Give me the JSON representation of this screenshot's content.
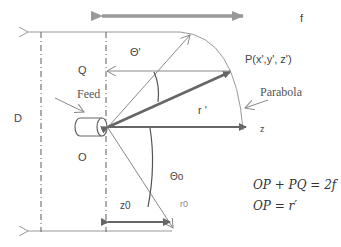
{
  "labels": {
    "f": "f",
    "theta_prime": "Θ'",
    "point": "P(x',y', z')",
    "Q": "Q",
    "feed": "Feed",
    "parabola": "Parabola",
    "D": "D",
    "r_prime": "r '",
    "z": "z",
    "O": "O",
    "theta0": "Θo",
    "z0": "z0",
    "r0": "r0"
  },
  "equations": [
    "OP + PQ = 2f",
    "OP = r′"
  ],
  "colors": {
    "line": "#888888",
    "thick_arrow": "#666666",
    "dimension_arrow": "#999999"
  }
}
